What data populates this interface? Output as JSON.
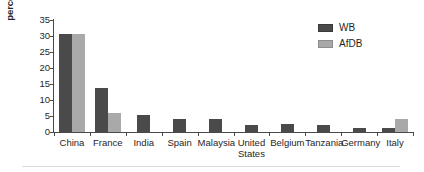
{
  "chart_data": {
    "type": "bar",
    "title": "",
    "subtitle": "",
    "xlabel": "",
    "ylabel": "percentage of total value",
    "ylim": [
      0,
      35
    ],
    "yticks": [
      0,
      5,
      10,
      15,
      20,
      25,
      30,
      35
    ],
    "grid": false,
    "legend_position": "top-right",
    "categories": [
      "China",
      "France",
      "India",
      "Spain",
      "Malaysia",
      "United\nStates",
      "Belgium",
      "Tanzania",
      "Germany",
      "Italy"
    ],
    "series": [
      {
        "name": "WB",
        "color": "#4a4a4a",
        "values": [
          30.7,
          13.8,
          5.2,
          4.2,
          4.0,
          2.3,
          2.4,
          2.3,
          1.4,
          1.3
        ]
      },
      {
        "name": "AfDB",
        "color": "#a9a9a9",
        "values": [
          30.7,
          6.0,
          0,
          0,
          0,
          0,
          0,
          0,
          0,
          4.1
        ]
      }
    ],
    "annotations": []
  },
  "legend": {
    "items": [
      {
        "label": "WB",
        "color": "#4a4a4a"
      },
      {
        "label": "AfDB",
        "color": "#a9a9a9"
      }
    ]
  },
  "axis": {
    "y_title": "percentage of total value",
    "y_ticks": [
      "0",
      "5",
      "10",
      "15",
      "20",
      "25",
      "30",
      "35"
    ]
  },
  "x_labels": [
    "China",
    "France",
    "India",
    "Spain",
    "Malaysia",
    "United\nStates",
    "Belgium",
    "Tanzania",
    "Germany",
    "Italy"
  ]
}
